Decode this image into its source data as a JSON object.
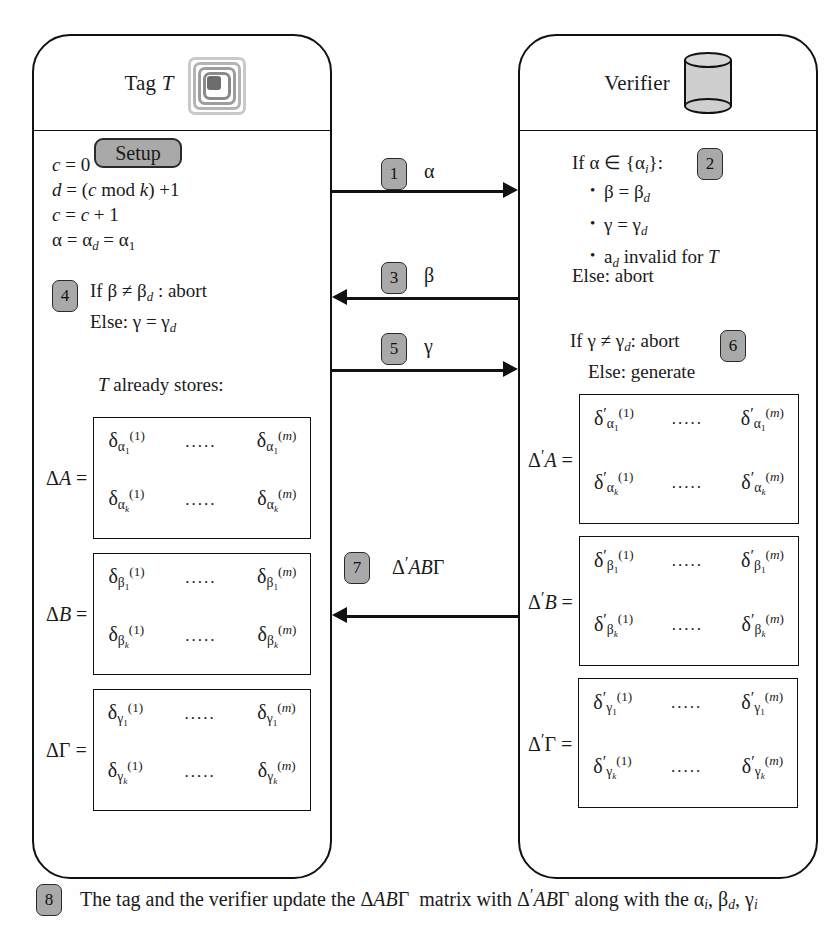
{
  "diagram": {
    "accent_gray": "#a9a9a9",
    "line_color": "#111111"
  },
  "tag_panel": {
    "title": "Tag",
    "title_italic": "T",
    "icon": "rfid-tag-icon",
    "setup_label": "Setup",
    "equations": [
      "c = 0",
      "d = (c mod k) +1",
      "c = c + 1",
      "α = αd = α1"
    ],
    "step4": {
      "number": "4",
      "line1": "If β ≠ βd : abort",
      "line2": "Else: γ = γd"
    },
    "stores_note": "T already stores:",
    "matrices": [
      {
        "label": "ΔA =",
        "cells": [
          "δα1(1)",
          "δα1(m)",
          "δαk(1)",
          "δαk(m)"
        ],
        "dots": "....."
      },
      {
        "label": "ΔB =",
        "cells": [
          "δβ1(1)",
          "δβ1(m)",
          "δβk(1)",
          "δβk(m)"
        ],
        "dots": "....."
      },
      {
        "label": "ΔΓ =",
        "cells": [
          "δγ1(1)",
          "δγ1(m)",
          "δγk(1)",
          "δγk(m)"
        ],
        "dots": "....."
      }
    ]
  },
  "verifier_panel": {
    "title": "Verifier",
    "icon": "database-cylinder-icon",
    "step2": {
      "number": "2",
      "condition": "If α ∈ {αi}:",
      "bullets": [
        "β = βd",
        "γ = γd",
        "ad invalid for T"
      ],
      "else": "Else: abort"
    },
    "step6": {
      "number": "6",
      "line1": "If γ ≠ γd: abort",
      "line2": "Else: generate"
    },
    "matrices": [
      {
        "label": "Δ′A =",
        "cells": [
          "δ′α1(1)",
          "δ′α1(m)",
          "δ′αk(1)",
          "δ′αk(m)"
        ],
        "dots": "....."
      },
      {
        "label": "Δ′B =",
        "cells": [
          "δ′β1(1)",
          "δ′β1(m)",
          "δ′βk(1)",
          "δ′βk(m)"
        ],
        "dots": "....."
      },
      {
        "label": "Δ′Γ =",
        "cells": [
          "δ′γ1(1)",
          "δ′γ1(m)",
          "δ′γk(1)",
          "δ′γk(m)"
        ],
        "dots": "....."
      }
    ]
  },
  "messages": [
    {
      "number": "1",
      "label": "α",
      "direction": "right"
    },
    {
      "number": "3",
      "label": "β",
      "direction": "left"
    },
    {
      "number": "5",
      "label": "γ",
      "direction": "right"
    },
    {
      "number": "7",
      "label": "Δ′ABΓ",
      "direction": "left"
    }
  ],
  "footer": {
    "number": "8",
    "text": "The tag and the verifier update the ΔABΓ  matrix with Δ′ABΓ along with the αi, βd, γi"
  }
}
